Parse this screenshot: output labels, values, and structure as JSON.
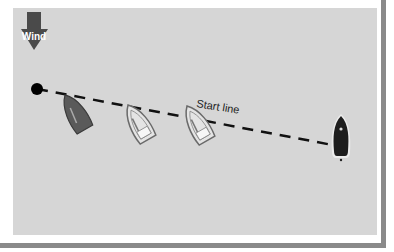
{
  "diagram": {
    "wind_label": "Wind",
    "start_line_label": "Start line",
    "colors": {
      "panel": "#d6d6d6",
      "arrow": "#4a4a4a",
      "line": "#111111",
      "border": "#8a8a8a",
      "boat_dark": "#3a3a3a",
      "boat_light": "#e6e6e6"
    },
    "elements": [
      {
        "type": "wind-arrow",
        "direction": "down"
      },
      {
        "type": "pin-mark",
        "label": ""
      },
      {
        "type": "boat",
        "shade": "dark-gray",
        "position": 1
      },
      {
        "type": "boat",
        "shade": "light",
        "position": 2
      },
      {
        "type": "boat",
        "shade": "light",
        "position": 3
      },
      {
        "type": "committee-boat",
        "shade": "black"
      }
    ]
  }
}
